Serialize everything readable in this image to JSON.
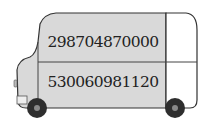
{
  "illustration": {
    "subject": "bus",
    "colors": {
      "body_fill": "#d9d9d9",
      "cab_fill": "#ffffff",
      "outline": "#333333",
      "wheel": "#2e2e2e",
      "hub": "#8a8a8a"
    },
    "panels": [
      {
        "position": "top",
        "value": "298704870000"
      },
      {
        "position": "bottom",
        "value": "530060981120"
      }
    ]
  }
}
